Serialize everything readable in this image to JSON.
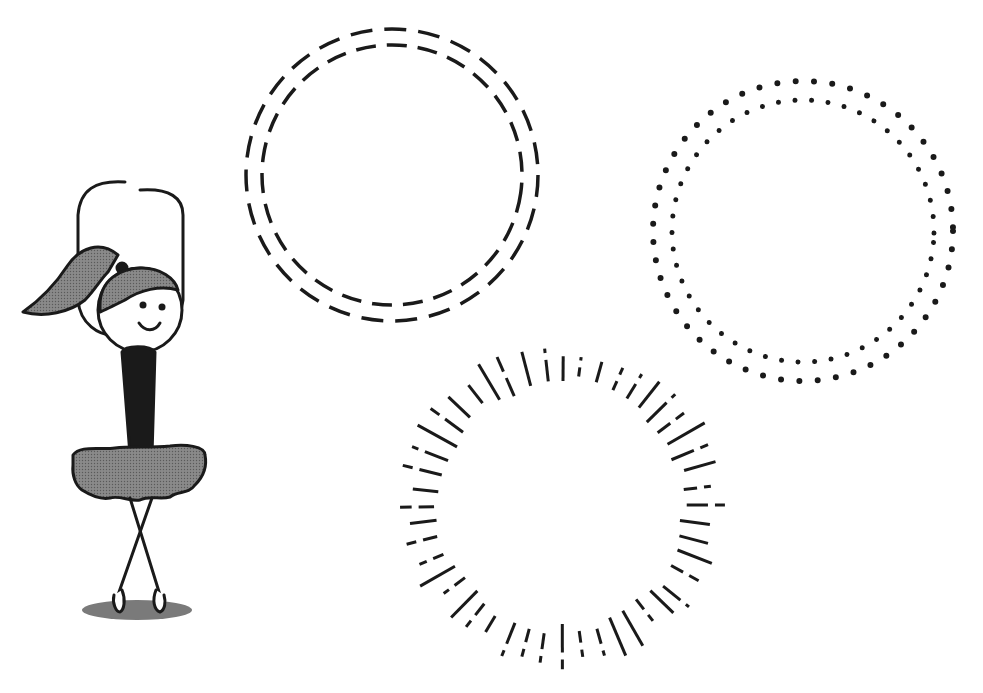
{
  "scene": {
    "description": "Black and white clip-art illustration: a stick-figure ballerina in a tutu and three decorative circle frames",
    "background": "#ffffff",
    "ink": "#1a1a1a",
    "fill_gray": "#7a7a7a"
  },
  "figures": [
    {
      "name": "ballerina",
      "x": 20,
      "y": 180,
      "width": 190,
      "height": 445,
      "pose": "arms raised overhead, legs crossed, ponytail"
    },
    {
      "name": "double-dashed-circle",
      "cx": 392,
      "cy": 175,
      "r_outer": 147,
      "r_inner": 130
    },
    {
      "name": "double-dotted-circle",
      "cx": 803,
      "cy": 231,
      "r_outer": 150,
      "r_inner": 130
    },
    {
      "name": "sunburst-circle",
      "cx": 562,
      "cy": 505,
      "r_inner": 118,
      "r_outer": 165,
      "rays": 48
    }
  ]
}
